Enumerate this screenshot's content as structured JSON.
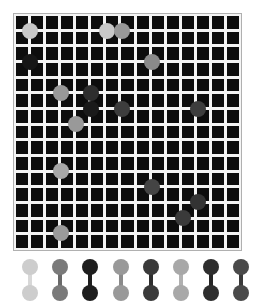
{
  "title": "",
  "board": {
    "cols": 15,
    "rows": 15,
    "cell_color": "#0d0d0d",
    "line_color": "#f4f4f4",
    "border_color": "#b0b0b0",
    "origin_x": 15,
    "origin_y": 15,
    "pitch_x": 15.27,
    "pitch_y": 15.6,
    "markers": [
      {
        "col": 1,
        "row": 1,
        "color": "#c8c8c8"
      },
      {
        "col": 6,
        "row": 1,
        "color": "#c8c8c8"
      },
      {
        "col": 7,
        "row": 1,
        "color": "#999999"
      },
      {
        "col": 1,
        "row": 3,
        "color": "#161616"
      },
      {
        "col": 9,
        "row": 3,
        "color": "#8a8a8a"
      },
      {
        "col": 3,
        "row": 5,
        "color": "#999999"
      },
      {
        "col": 5,
        "row": 5,
        "color": "#2e2e2e"
      },
      {
        "col": 5,
        "row": 6,
        "color": "#1a1a1a"
      },
      {
        "col": 7,
        "row": 6,
        "color": "#3d3d3d"
      },
      {
        "col": 12,
        "row": 6,
        "color": "#3d3d3d"
      },
      {
        "col": 4,
        "row": 7,
        "color": "#999999"
      },
      {
        "col": 3,
        "row": 10,
        "color": "#a8a8a8"
      },
      {
        "col": 9,
        "row": 11,
        "color": "#444444"
      },
      {
        "col": 12,
        "row": 12,
        "color": "#333333"
      },
      {
        "col": 11,
        "row": 13,
        "color": "#3a3a3a"
      },
      {
        "col": 3,
        "row": 14,
        "color": "#9a9a9a"
      }
    ]
  },
  "tray": {
    "pieces": [
      {
        "x": 30,
        "color": "#cdcdcd",
        "bar": "#d8d8d8"
      },
      {
        "x": 60,
        "color": "#7a7a7a",
        "bar": "#6a6a6a"
      },
      {
        "x": 90,
        "color": "#1e1e1e",
        "bar": "#1e1e1e"
      },
      {
        "x": 121,
        "color": "#999999",
        "bar": "#8a8a8a"
      },
      {
        "x": 151,
        "color": "#3a3a3a",
        "bar": "#2e2e2e"
      },
      {
        "x": 181,
        "color": "#a8a8a8",
        "bar": "#b0b0b0"
      },
      {
        "x": 211,
        "color": "#2e2e2e",
        "bar": "#262626"
      },
      {
        "x": 241,
        "color": "#4a4a4a",
        "bar": "#3a3a3a"
      }
    ]
  }
}
